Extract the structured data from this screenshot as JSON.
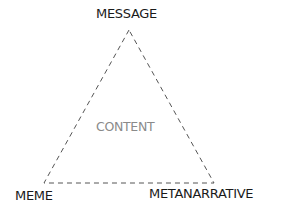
{
  "diagram": {
    "type": "triangle",
    "center_label": "CONTENT",
    "vertices": [
      {
        "position": "top",
        "label": "MESSAGE"
      },
      {
        "position": "bottom-left",
        "label": "MEME"
      },
      {
        "position": "bottom-right",
        "label": "METANARRATIVE"
      }
    ],
    "edge_style": "dashed",
    "colors": {
      "edge": "#555555",
      "label": "#1a1a1a",
      "center_label": "#8a8a8a"
    }
  }
}
